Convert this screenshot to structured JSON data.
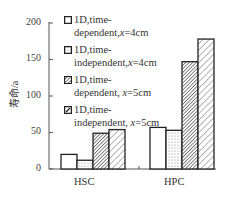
{
  "chart_data": {
    "type": "bar",
    "title": "",
    "xlabel": "",
    "ylabel": "寿命/a",
    "ylim": [
      0,
      200
    ],
    "yticks": [
      0,
      50,
      100,
      150,
      200
    ],
    "categories": [
      "HSC",
      "HPC"
    ],
    "series": [
      {
        "name": "1D,time-dependent,x=4cm",
        "pattern": "white",
        "values": [
          20,
          57
        ]
      },
      {
        "name": "1D,time-independent,x=4cm",
        "pattern": "dotted",
        "values": [
          12,
          53
        ]
      },
      {
        "name": "1D,time-dependent, x=5cm",
        "pattern": "dense-hatch",
        "values": [
          49,
          147
        ]
      },
      {
        "name": "1D,time-independent, x=5cm",
        "pattern": "sparse-hatch",
        "values": [
          54,
          178
        ]
      }
    ],
    "grid": false,
    "legend_position": "upper-left-inside"
  },
  "legend": [
    {
      "line1": "1D,time-",
      "line2a": "dependent,",
      "var": "x",
      "line2b": "=4cm"
    },
    {
      "line1": "1D,time-",
      "line2a": "independent,",
      "var": "x",
      "line2b": "=4cm"
    },
    {
      "line1": "1D,time-",
      "line2a": "dependent, ",
      "var": "x",
      "line2b": "=5cm"
    },
    {
      "line1": "1D,time-",
      "line2a": "independent, ",
      "var": "x",
      "line2b": "=5cm"
    }
  ],
  "axis": {
    "y_label": "寿命/a",
    "y_ticks": [
      "200",
      "150",
      "100",
      "50",
      "0"
    ],
    "x_categories": [
      "HSC",
      "HPC"
    ]
  }
}
